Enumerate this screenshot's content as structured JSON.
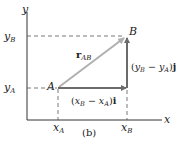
{
  "figure": {
    "caption": "(b)",
    "axes": {
      "x_label": "x",
      "y_label": "y"
    },
    "ticks": {
      "x": [
        {
          "main": "x",
          "sub": "A"
        },
        {
          "main": "x",
          "sub": "B"
        }
      ],
      "y": [
        {
          "main": "y",
          "sub": "B"
        },
        {
          "main": "y",
          "sub": "A"
        }
      ]
    },
    "points": {
      "A": "A",
      "B": "B"
    },
    "vectors": {
      "r_ab": {
        "main": "r",
        "sub": "AB"
      },
      "horizontal": {
        "open": "(",
        "x1": "x",
        "s1": "B",
        "minus": " − ",
        "x2": "x",
        "s2": "A",
        "close": ")",
        "unit": "i"
      },
      "vertical": {
        "open": "(",
        "x1": "y",
        "s1": "B",
        "minus": " − ",
        "x2": "y",
        "s2": "A",
        "close": ")",
        "unit": "j"
      }
    },
    "colors": {
      "axis": "#333333",
      "vector_dark": "#6b6b6b",
      "vector_light": "#b0b0b0",
      "dashed": "#555555"
    }
  }
}
